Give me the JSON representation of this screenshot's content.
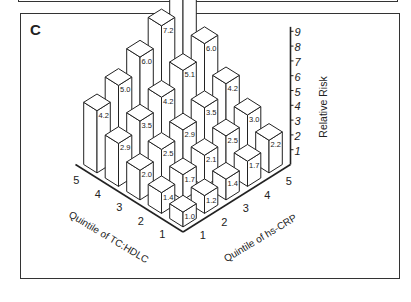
{
  "panel": {
    "letter": "C"
  },
  "chart_data": {
    "type": "bar3d",
    "title": "",
    "zlabel": "Relative Risk",
    "xlabel": "Quintile of TC:HDLC",
    "ylabel": "Quintile of hs-CRP",
    "x_categories": [
      "1",
      "2",
      "3",
      "4",
      "5"
    ],
    "y_categories": [
      "1",
      "2",
      "3",
      "4",
      "5"
    ],
    "zlim": [
      0,
      9
    ],
    "z_ticks": [
      "1",
      "2",
      "3",
      "4",
      "5",
      "6",
      "7",
      "8",
      "9"
    ],
    "grid": false,
    "legend": null,
    "values_by_tchdlc_row": [
      {
        "tc_hdlc": 1,
        "hs_crp": [
          1.0,
          1.2,
          1.4,
          1.7,
          2.2
        ]
      },
      {
        "tc_hdlc": 2,
        "hs_crp": [
          1.4,
          1.7,
          2.1,
          2.5,
          3.0
        ]
      },
      {
        "tc_hdlc": 3,
        "hs_crp": [
          2.0,
          2.5,
          2.9,
          3.5,
          4.2
        ]
      },
      {
        "tc_hdlc": 4,
        "hs_crp": [
          2.9,
          3.5,
          4.2,
          5.1,
          6.0
        ]
      },
      {
        "tc_hdlc": 5,
        "hs_crp": [
          4.2,
          5.0,
          6.0,
          7.2,
          8.7
        ]
      }
    ]
  }
}
